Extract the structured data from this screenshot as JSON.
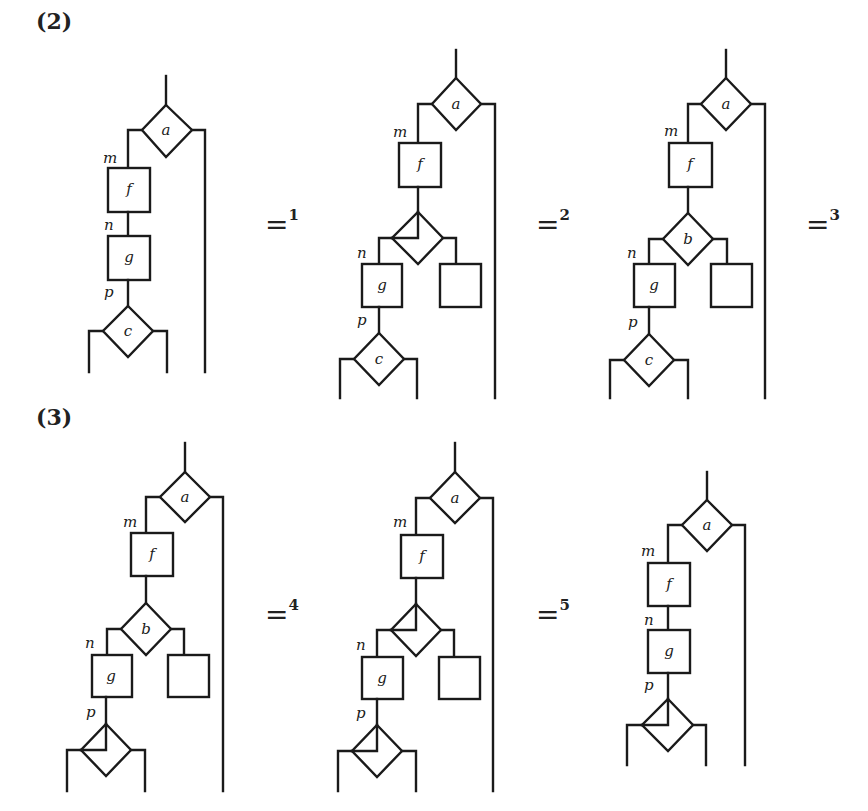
{
  "sections": [
    {
      "label": "(2)"
    },
    {
      "label": "(3)"
    }
  ],
  "equalities": [
    {
      "symbol": "=",
      "index": "1"
    },
    {
      "symbol": "=",
      "index": "2"
    },
    {
      "symbol": "=",
      "index": "3"
    },
    {
      "symbol": "=",
      "index": "4"
    },
    {
      "symbol": "=",
      "index": "5"
    }
  ],
  "edge_labels": {
    "m": "m",
    "n": "n",
    "p": "p"
  },
  "diagrams": [
    {
      "id": 1,
      "row": "(2)",
      "top_decision": "a",
      "process_1": "f",
      "process_2": "g",
      "middle_decision": null,
      "bottom_decision": "c"
    },
    {
      "id": 2,
      "row": "(2)",
      "top_decision": "a",
      "process_1": "f",
      "middle_decision": "split-diamond",
      "process_2": "g",
      "empty_box": "",
      "bottom_decision": "c"
    },
    {
      "id": 3,
      "row": "(2)",
      "top_decision": "a",
      "process_1": "f",
      "middle_decision": "b",
      "process_2": "g",
      "empty_box": "",
      "bottom_decision": "c"
    },
    {
      "id": 4,
      "row": "(3)",
      "top_decision": "a",
      "process_1": "f",
      "middle_decision": "b",
      "process_2": "g",
      "empty_box": "",
      "bottom_decision": "split-diamond"
    },
    {
      "id": 5,
      "row": "(3)",
      "top_decision": "a",
      "process_1": "f",
      "middle_decision": "split-diamond",
      "process_2": "g",
      "empty_box": "",
      "bottom_decision": "split-diamond"
    },
    {
      "id": 6,
      "row": "(3)",
      "top_decision": "a",
      "process_1": "f",
      "process_2": "g",
      "middle_decision": null,
      "bottom_decision": "split-diamond"
    }
  ],
  "node_labels": {
    "a": "a",
    "b": "b",
    "c": "c",
    "f": "f",
    "g": "g"
  }
}
